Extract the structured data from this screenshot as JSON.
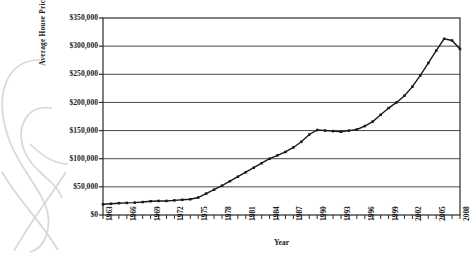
{
  "chart_data": {
    "type": "line",
    "title": "",
    "xlabel": "Year",
    "ylabel": "Average House Price",
    "ylim": [
      0,
      350000
    ],
    "xlim": [
      1963,
      2008
    ],
    "grid": "horizontal",
    "legend": "none",
    "ytick_labels": [
      "$350,000",
      "$300,000",
      "$250,000",
      "$200,000",
      "$150,000",
      "$100,000",
      "$50,000",
      "$0"
    ],
    "ytick_values": [
      350000,
      300000,
      250000,
      200000,
      150000,
      100000,
      50000,
      0
    ],
    "xtick_labels": [
      "1963",
      "1966",
      "1969",
      "1972",
      "1975",
      "1978",
      "1981",
      "1984",
      "1987",
      "1990",
      "1993",
      "1996",
      "1999",
      "2002",
      "2005",
      "2008"
    ],
    "xtick_values": [
      1963,
      1966,
      1969,
      1972,
      1975,
      1978,
      1981,
      1984,
      1987,
      1990,
      1993,
      1996,
      1999,
      2002,
      2005,
      2008
    ],
    "marker": "square",
    "line_color": "#1a1a1a",
    "x": [
      1963,
      1964,
      1965,
      1966,
      1967,
      1968,
      1969,
      1970,
      1971,
      1972,
      1973,
      1974,
      1975,
      1976,
      1977,
      1978,
      1979,
      1980,
      1981,
      1982,
      1983,
      1984,
      1985,
      1986,
      1987,
      1988,
      1989,
      1990,
      1991,
      1992,
      1993,
      1994,
      1995,
      1996,
      1997,
      1998,
      1999,
      2000,
      2001,
      2002,
      2003,
      2004,
      2005,
      2006,
      2007,
      2008
    ],
    "values": [
      19000,
      20000,
      21000,
      21500,
      22000,
      23000,
      24500,
      25000,
      25000,
      26000,
      27000,
      28000,
      31000,
      38000,
      45000,
      52000,
      60000,
      68000,
      76000,
      84000,
      92000,
      100000,
      106000,
      112000,
      120000,
      130000,
      143000,
      151000,
      150000,
      149000,
      148000,
      150000,
      152000,
      158000,
      166000,
      178000,
      190000,
      200000,
      212000,
      228000,
      248000,
      270000,
      292000,
      313000,
      310000,
      295000
    ]
  },
  "axis": {
    "ylabel": "Average House Price",
    "xlabel": "Year"
  }
}
